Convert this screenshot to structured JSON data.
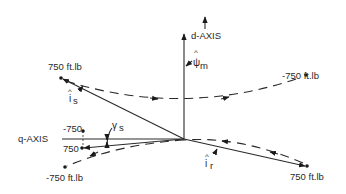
{
  "figure": {
    "axes": {
      "d_axis_label": "d-AXIS",
      "q_axis_label": "q-AXIS"
    },
    "vectors": {
      "magnetizing_flux": {
        "symbol": "ψ",
        "hat": "^",
        "subscript": "m"
      },
      "stator_current": {
        "symbol": "i",
        "hat": "^",
        "subscript": "s"
      },
      "rotor_current": {
        "symbol": "i",
        "hat": "^",
        "subscript": "r"
      },
      "stator_angle": {
        "symbol": "γ",
        "subscript": "s"
      }
    },
    "points": {
      "stator_positive": "750 ft.lb",
      "stator_negative": "-750 ft.lb",
      "rotor_positive": "750 ft.lb",
      "rotor_negative": "-750 ft.lb",
      "q_axis_negative": "-750",
      "q_axis_positive": "750"
    }
  },
  "colors": {
    "ink": "#2a2a2a",
    "background": "#ffffff"
  }
}
